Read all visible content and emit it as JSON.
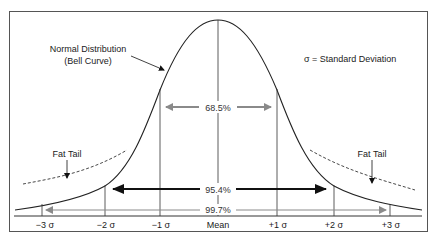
{
  "diagram": {
    "title_annotation": {
      "line1": "Normal Distribution",
      "line2": "(Bell Curve)"
    },
    "legend": "σ = Standard Deviation",
    "fat_tail_left": "Fat Tail",
    "fat_tail_right": "Fat Tail",
    "intervals": [
      {
        "label": "68.5%",
        "range": "±1σ",
        "arrow_color": "#8a8a8a"
      },
      {
        "label": "95.4%",
        "range": "±2σ",
        "arrow_color": "#111111"
      },
      {
        "label": "99.7%",
        "range": "±3σ",
        "arrow_color": "#8a8a8a"
      }
    ],
    "axis_ticks": [
      {
        "label": "−3 σ"
      },
      {
        "label": "−2 σ"
      },
      {
        "label": "−1 σ"
      },
      {
        "label": "Mean"
      },
      {
        "label": "+1 σ"
      },
      {
        "label": "+2 σ"
      },
      {
        "label": "+3 σ"
      }
    ],
    "colors": {
      "curve": "#222222",
      "frame": "#555555",
      "gray_arrow": "#8a8a8a",
      "black_arrow": "#111111"
    }
  }
}
